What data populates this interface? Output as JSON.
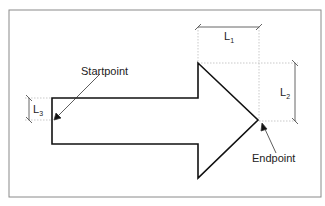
{
  "diagram": {
    "labels": {
      "startpoint": "Startpoint",
      "endpoint": "Endpoint",
      "l1": "L",
      "l1_sub": "1",
      "l2": "L",
      "l2_sub": "2",
      "l3": "L",
      "l3_sub": "3"
    },
    "colors": {
      "frame": "#8a8a8a",
      "arrow_outline": "#111111",
      "guide": "#bbbbbb",
      "dimension": "#555555"
    }
  }
}
